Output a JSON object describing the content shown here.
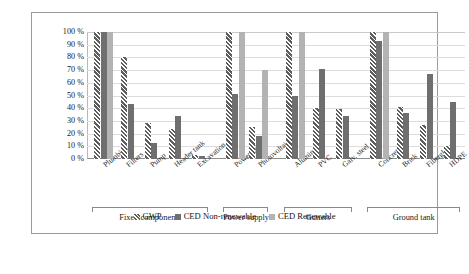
{
  "chart_data": {
    "type": "bar",
    "title": "",
    "subtitle": "",
    "xlabel": "",
    "ylabel": "",
    "ylim": [
      0,
      100
    ],
    "ytick_labels": [
      "100 %",
      "90 %",
      "80 %",
      "70 %",
      "60 %",
      "50 %",
      "40 %",
      "30 %",
      "20 %",
      "10 %",
      "0 %"
    ],
    "ytick_values": [
      100,
      90,
      80,
      70,
      60,
      50,
      40,
      30,
      20,
      10,
      0
    ],
    "grid": true,
    "legend_position": "bottom",
    "categories": [
      "Plumbing",
      "Filters",
      "Pump",
      "Header tank",
      "Excavation",
      "Power grid",
      "Photovoltaic",
      "Aluminum",
      "PVC",
      "Galv. steel",
      "Concrete",
      "Brick",
      "Fiberglass",
      "HDPE"
    ],
    "series": [
      {
        "name": "GWP",
        "style": "hatched",
        "color": "#6e6e6e",
        "values": [
          100,
          80,
          28,
          24,
          3,
          100,
          25,
          100,
          40,
          39,
          100,
          41,
          27,
          10
        ]
      },
      {
        "name": "CED Non-renewable",
        "style": "solid-dark",
        "color": "#6f6f6f",
        "values": [
          100,
          43,
          13,
          34,
          2,
          51,
          18,
          50,
          71,
          34,
          93,
          36,
          67,
          45
        ]
      },
      {
        "name": "CED Renewable",
        "style": "solid-light",
        "color": "#b3b3b3",
        "values": [
          100,
          null,
          null,
          null,
          null,
          100,
          70,
          100,
          null,
          null,
          100,
          null,
          null,
          null
        ]
      }
    ],
    "groups": [
      {
        "label": "Fixed components",
        "categories": [
          "Plumbing",
          "Filters",
          "Pump",
          "Header tank",
          "Excavation"
        ]
      },
      {
        "label": "Power supply",
        "categories": [
          "Power grid",
          "Photovoltaic"
        ]
      },
      {
        "label": "Gutters",
        "categories": [
          "Aluminum",
          "PVC",
          "Galv. steel"
        ]
      },
      {
        "label": "Ground tank",
        "categories": [
          "Concrete",
          "Brick",
          "Fiberglass",
          "HDPE"
        ]
      }
    ]
  },
  "legend": {
    "items": [
      {
        "label": "GWP"
      },
      {
        "label": "CED Non-renewable"
      },
      {
        "label": "CED Renewable"
      }
    ]
  }
}
